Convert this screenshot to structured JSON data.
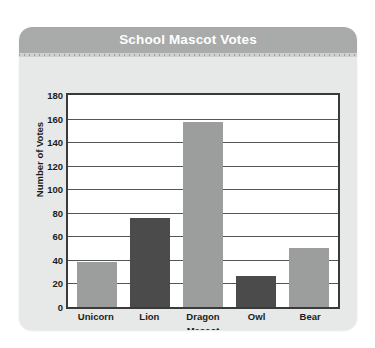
{
  "card": {
    "title": "School Mascot Votes"
  },
  "chart_data": {
    "type": "bar",
    "title": "School Mascot Votes",
    "xlabel": "Mascot",
    "ylabel": "Number of Votes",
    "categories": [
      "Unicorn",
      "Lion",
      "Dragon",
      "Owl",
      "Bear"
    ],
    "values": [
      38,
      76,
      157,
      26,
      50
    ],
    "bar_colors": [
      "#9c9d9d",
      "#4b4b4b",
      "#9c9d9d",
      "#4b4b4b",
      "#9c9d9d"
    ],
    "ylim": [
      0,
      180
    ],
    "ytick_step": 20,
    "yticks": [
      0,
      20,
      40,
      60,
      80,
      100,
      120,
      140,
      160,
      180
    ],
    "ytick_labels": [
      "0",
      "20",
      "40",
      "60",
      "80",
      "100",
      "120",
      "140",
      "160",
      "180"
    ],
    "grid": true,
    "legend": false,
    "colors": {
      "header_bar": "#a9aaaa",
      "card_background": "#e7e8e8",
      "plot_background": "#ffffff",
      "plot_border": "#3a3a3a",
      "gridline": "#555555",
      "title_text": "#ffffff",
      "axis_text": "#1c1c1c",
      "bar_light": "#9c9d9d",
      "bar_dark": "#4b4b4b"
    }
  }
}
